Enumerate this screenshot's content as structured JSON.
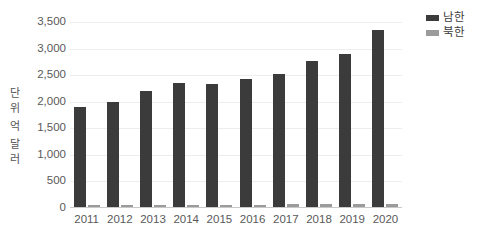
{
  "chart_data": {
    "type": "bar",
    "title": "",
    "xlabel": "",
    "ylabel": "단위 억 달러",
    "ylabel_chars": [
      "단",
      "위",
      "억",
      "달",
      "러"
    ],
    "categories": [
      "2011",
      "2012",
      "2013",
      "2014",
      "2015",
      "2016",
      "2017",
      "2018",
      "2019",
      "2020"
    ],
    "series": [
      {
        "name": "남한",
        "color": "#3b3b3b",
        "values": [
          1900,
          1990,
          2210,
          2360,
          2330,
          2420,
          2530,
          2770,
          2890,
          3350
        ]
      },
      {
        "name": "북한",
        "color": "#9b9b9b",
        "values": [
          60,
          60,
          60,
          60,
          60,
          65,
          70,
          70,
          70,
          70
        ]
      }
    ],
    "ylim": [
      0,
      3500
    ],
    "yticks": [
      0,
      500,
      1000,
      1500,
      2000,
      2500,
      3000,
      3500
    ],
    "ytick_labels": [
      "0",
      "500",
      "1,000",
      "1,500",
      "2,000",
      "2,500",
      "3,000",
      "3,500"
    ],
    "grid": true,
    "legend_position": "top-right"
  },
  "legend": {
    "items": [
      {
        "label": "남한",
        "color": "#3b3b3b",
        "swatch": "legend-swatch-south"
      },
      {
        "label": "북한",
        "color": "#9b9b9b",
        "swatch": "legend-swatch-north"
      }
    ]
  },
  "colors": {
    "south": "#3b3b3b",
    "north": "#9b9b9b",
    "grid": "#ededed",
    "axis": "#c9c9c9",
    "text": "#595959",
    "background": "#ffffff"
  }
}
